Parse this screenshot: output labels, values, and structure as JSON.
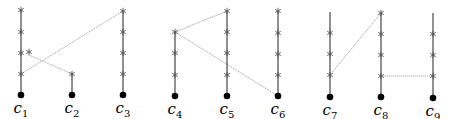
{
  "columns": [
    {
      "id": "c1",
      "label": "c",
      "sub": "1",
      "x": 21,
      "dot_y": 95,
      "line_top": 10,
      "stars": [
        10,
        32,
        53,
        74
      ]
    },
    {
      "id": "c2",
      "label": "c",
      "sub": "2",
      "x": 72,
      "dot_y": 95,
      "line_top": 74,
      "stars": [
        74
      ]
    },
    {
      "id": "c3",
      "label": "c",
      "sub": "3",
      "x": 123,
      "dot_y": 95,
      "line_top": 11,
      "stars": [
        11,
        32,
        53,
        74
      ]
    },
    {
      "id": "c4",
      "label": "c",
      "sub": "4",
      "x": 175,
      "dot_y": 96,
      "line_top": 32,
      "stars": [
        32,
        53,
        75
      ]
    },
    {
      "id": "c5",
      "label": "c",
      "sub": "5",
      "x": 227,
      "dot_y": 96,
      "line_top": 11,
      "stars": [
        11,
        32,
        53,
        75
      ]
    },
    {
      "id": "c6",
      "label": "c",
      "sub": "6",
      "x": 278,
      "dot_y": 96,
      "line_top": 11,
      "stars": [
        11,
        33,
        54,
        75
      ]
    },
    {
      "id": "c7",
      "label": "c",
      "sub": "7",
      "x": 330,
      "dot_y": 97,
      "line_top": 12,
      "stars": [
        33,
        54,
        75
      ]
    },
    {
      "id": "c8",
      "label": "c",
      "sub": "8",
      "x": 381,
      "dot_y": 97,
      "line_top": 13,
      "stars": [
        13,
        34,
        55,
        76
      ]
    },
    {
      "id": "c9",
      "label": "c",
      "sub": "9",
      "x": 433,
      "dot_y": 98,
      "line_top": 13,
      "stars": [
        34,
        55,
        76
      ]
    }
  ],
  "extra_stars": [
    {
      "x": 29,
      "y": 52
    }
  ],
  "edges": [
    {
      "x1": 21,
      "y1": 74,
      "x2": 123,
      "y2": 11,
      "style": "dotted"
    },
    {
      "x1": 29,
      "y1": 55,
      "x2": 72,
      "y2": 74,
      "style": "dotted"
    },
    {
      "x1": 175,
      "y1": 32,
      "x2": 227,
      "y2": 11,
      "style": "dotted"
    },
    {
      "x1": 175,
      "y1": 32,
      "x2": 278,
      "y2": 96,
      "style": "dotted"
    },
    {
      "x1": 330,
      "y1": 75,
      "x2": 381,
      "y2": 13,
      "style": "dotted"
    },
    {
      "x1": 381,
      "y1": 76,
      "x2": 433,
      "y2": 76,
      "style": "dotted"
    }
  ],
  "colors": {
    "line": "#222222",
    "edge": "#999999",
    "star": "#555555",
    "dot": "#000000"
  }
}
